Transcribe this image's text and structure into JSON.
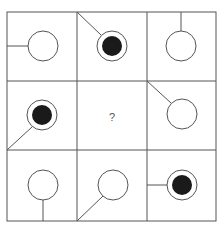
{
  "puzzle": {
    "question_mark": "?",
    "colors": {
      "line": "#555555",
      "fill": "#1a1a1a",
      "background": "#ffffff"
    },
    "cells": [
      {
        "row": 0,
        "col": 0,
        "circle": "hollow",
        "line_from": "left-edge-middle"
      },
      {
        "row": 0,
        "col": 1,
        "circle": "filled",
        "line_from": "top-left-corner"
      },
      {
        "row": 0,
        "col": 2,
        "circle": "hollow",
        "line_from": "top-edge-middle"
      },
      {
        "row": 1,
        "col": 0,
        "circle": "filled",
        "line_from": "bottom-left-corner"
      },
      {
        "row": 1,
        "col": 1,
        "circle": "unknown",
        "line_from": "none",
        "label": "?"
      },
      {
        "row": 1,
        "col": 2,
        "circle": "hollow",
        "line_from": "top-left-corner"
      },
      {
        "row": 2,
        "col": 0,
        "circle": "hollow",
        "line_from": "bottom-edge-middle"
      },
      {
        "row": 2,
        "col": 1,
        "circle": "hollow",
        "line_from": "bottom-left-corner"
      },
      {
        "row": 2,
        "col": 2,
        "circle": "filled",
        "line_from": "left-edge-middle"
      }
    ]
  }
}
